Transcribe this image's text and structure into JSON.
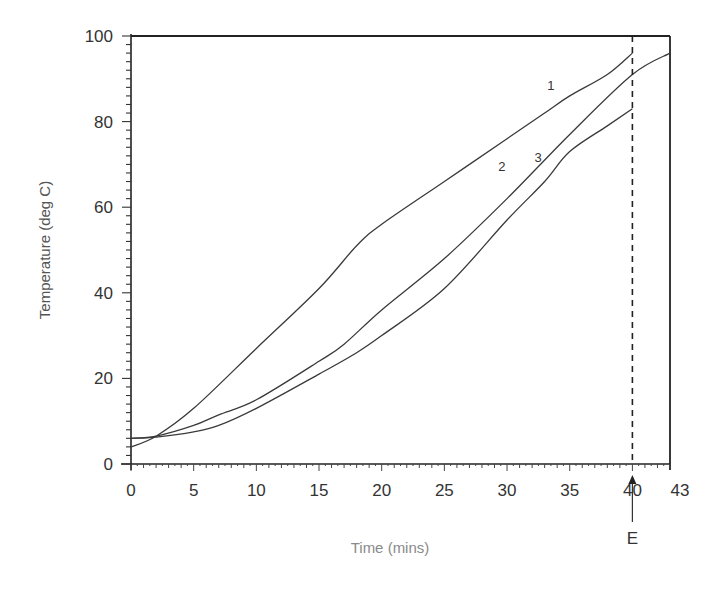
{
  "chart_data": {
    "type": "line",
    "title": "",
    "xlabel": "Time (mins)",
    "ylabel": "Temperature (deg C)",
    "xlim": [
      0,
      43
    ],
    "ylim": [
      0,
      100
    ],
    "x_ticks": [
      0,
      5,
      10,
      15,
      20,
      25,
      30,
      35,
      40,
      43
    ],
    "x_tick_labels": [
      "0",
      "5",
      "10",
      "15",
      "20",
      "25",
      "30",
      "35",
      "40",
      "43"
    ],
    "y_ticks": [
      0,
      20,
      40,
      60,
      80,
      100
    ],
    "y_tick_labels": [
      "0",
      "20",
      "40",
      "60",
      "80",
      "100"
    ],
    "grid": false,
    "legend": "inline labels",
    "series": [
      {
        "name": "1",
        "x": [
          0,
          2,
          5,
          10,
          15,
          18,
          20,
          25,
          30,
          33,
          35,
          38,
          40
        ],
        "y": [
          4,
          6.5,
          13,
          27,
          41,
          51,
          56,
          66,
          76,
          82,
          86,
          91,
          96
        ]
      },
      {
        "name": "2",
        "x": [
          0,
          2,
          5,
          7,
          10,
          15,
          17,
          20,
          25,
          30,
          35,
          40,
          43
        ],
        "y": [
          6,
          6.5,
          9,
          11.5,
          15,
          24,
          28,
          36,
          48,
          62,
          77,
          91,
          96
        ]
      },
      {
        "name": "3",
        "x": [
          0,
          2,
          5,
          7,
          10,
          15,
          18,
          20,
          25,
          30,
          33,
          35,
          38,
          40
        ],
        "y": [
          6,
          6.3,
          7.5,
          9,
          13,
          21,
          26,
          30,
          41,
          57,
          66,
          73,
          79,
          83
        ]
      }
    ],
    "annotations": [
      {
        "text": "E",
        "x": 40,
        "description": "dashed vertical marker at t=40 with upward arrow"
      }
    ]
  }
}
